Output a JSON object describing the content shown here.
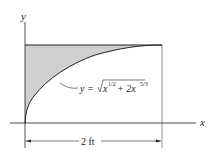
{
  "diagram": {
    "axes": {
      "x_label": "x",
      "y_label": "y"
    },
    "equation": {
      "lhs": "y = ",
      "radicand_a": "x",
      "exp_a": "1/2",
      "plus": " + 2x",
      "exp_b": "5/3"
    },
    "dimension": {
      "label": "2 ft"
    },
    "colors": {
      "shade": "#cfcfcf",
      "line": "#222222"
    }
  }
}
